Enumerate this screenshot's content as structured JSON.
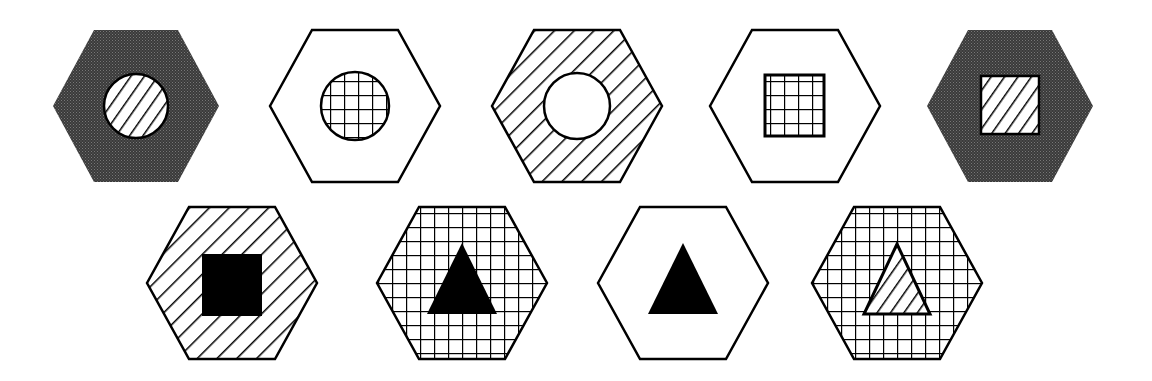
{
  "figure": {
    "colors": {
      "stroke": "#000000",
      "background": "#ffffff",
      "dark_fill": "#3a3a3a",
      "dark_dot": "#6a6a6a"
    },
    "row1": [
      {
        "id": 1,
        "cx": 136,
        "cy": 106,
        "hex_fill": "dark",
        "shape": "circle",
        "shape_fill": "diagonal"
      },
      {
        "id": 2,
        "cx": 355,
        "cy": 106,
        "hex_fill": "white",
        "shape": "circle",
        "shape_fill": "grid"
      },
      {
        "id": 3,
        "cx": 577,
        "cy": 106,
        "hex_fill": "diagonal",
        "shape": "circle",
        "shape_fill": "white"
      },
      {
        "id": 4,
        "cx": 795,
        "cy": 106,
        "hex_fill": "white",
        "shape": "square",
        "shape_fill": "grid"
      },
      {
        "id": 5,
        "cx": 1010,
        "cy": 106,
        "hex_fill": "dark",
        "shape": "square",
        "shape_fill": "diagonal"
      }
    ],
    "row2": [
      {
        "id": 6,
        "cx": 232,
        "cy": 283,
        "hex_fill": "diagonal",
        "shape": "square",
        "shape_fill": "black"
      },
      {
        "id": 7,
        "cx": 462,
        "cy": 283,
        "hex_fill": "grid",
        "shape": "triangle",
        "shape_fill": "black"
      },
      {
        "id": 8,
        "cx": 683,
        "cy": 283,
        "hex_fill": "white",
        "shape": "triangle",
        "shape_fill": "black"
      },
      {
        "id": 9,
        "cx": 897,
        "cy": 283,
        "hex_fill": "grid",
        "shape": "triangle",
        "shape_fill": "diagonal"
      }
    ]
  }
}
